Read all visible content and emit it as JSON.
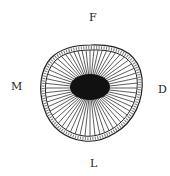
{
  "diagram": {
    "type": "cross-section",
    "labels": {
      "top": "F",
      "left": "M",
      "right": "D",
      "bottom": "L"
    },
    "colors": {
      "outline": "#222222",
      "core": "#111111",
      "rays": "#333333",
      "background": "#ffffff"
    },
    "ray_count": 60
  }
}
